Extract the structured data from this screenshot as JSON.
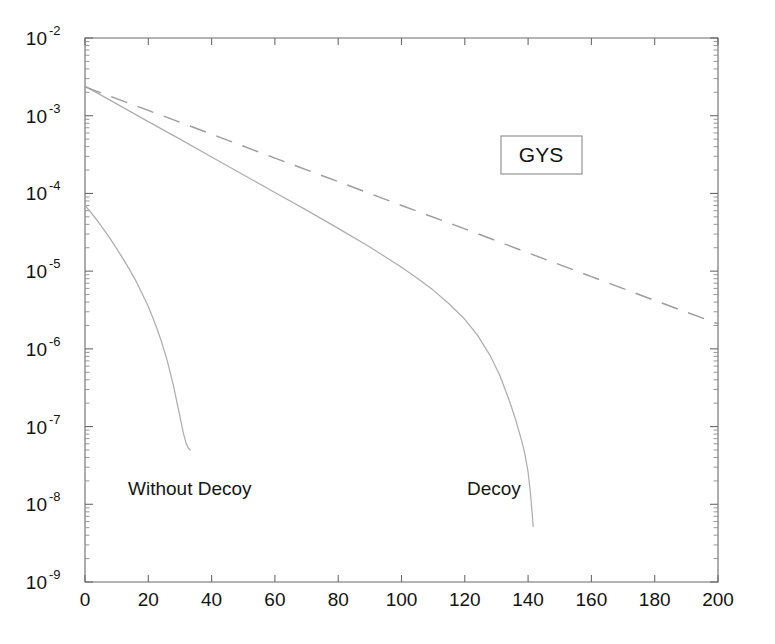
{
  "chart_data": {
    "type": "line",
    "title": "",
    "xlabel": "",
    "ylabel": "",
    "xlim": [
      0,
      200
    ],
    "ylim": [
      1e-09,
      0.01
    ],
    "yscale": "log",
    "xscale": "linear",
    "grid": false,
    "legend_position": "inside-upper-right",
    "legend_entries": [
      "GYS"
    ],
    "xticks": [
      0,
      20,
      40,
      60,
      80,
      100,
      120,
      140,
      160,
      180,
      200
    ],
    "xtick_labels": [
      "0",
      "20",
      "40",
      "60",
      "80",
      "100",
      "120",
      "140",
      "160",
      "180",
      "200"
    ],
    "yticks": [
      1e-09,
      1e-08,
      1e-07,
      1e-06,
      1e-05,
      0.0001,
      0.001,
      0.01
    ],
    "ytick_labels": [
      "10-9",
      "10-8",
      "10-7",
      "10-6",
      "10-5",
      "10-4",
      "10-3",
      "10-2"
    ],
    "ytick_base": "10",
    "ytick_exponents": [
      "-9",
      "-8",
      "-7",
      "-6",
      "-5",
      "-4",
      "-3",
      "-2"
    ],
    "annotations": [
      {
        "text": "Without Decoy",
        "x": 14,
        "y": 1.7e-08
      },
      {
        "text": "Decoy",
        "x": 117,
        "y": 1.7e-08
      },
      {
        "text": "GYS",
        "x": 156,
        "y": 0.00032,
        "boxed": true
      }
    ],
    "series": [
      {
        "name": "Without Decoy",
        "style": "solid",
        "color": "#aeaeae",
        "x": [
          0,
          2,
          4,
          6,
          8,
          10,
          12,
          14,
          16,
          18,
          20,
          22,
          24,
          26,
          28,
          29,
          30,
          31,
          32,
          32.5,
          33,
          33.2
        ],
        "y": [
          7e-05,
          5.6e-05,
          4.4e-05,
          3.4e-05,
          2.6e-05,
          1.95e-05,
          1.45e-05,
          1.06e-05,
          7.6e-06,
          5.2e-06,
          3.5e-06,
          2.2e-06,
          1.3e-06,
          7e-07,
          3.3e-07,
          2.1e-07,
          1.35e-07,
          8.5e-08,
          6e-08,
          5.4e-08,
          5.1e-08,
          5e-08
        ]
      },
      {
        "name": "Decoy",
        "style": "solid",
        "color": "#aeaeae",
        "x": [
          0,
          10,
          20,
          30,
          40,
          50,
          60,
          70,
          80,
          90,
          100,
          105,
          110,
          115,
          120,
          124,
          128,
          131,
          134,
          136,
          138,
          139,
          140,
          140.8,
          141.3,
          141.6
        ],
        "y": [
          0.0024,
          0.00142,
          0.00084,
          0.0005,
          0.000295,
          0.000174,
          0.000103,
          6.1e-05,
          3.55e-05,
          2.05e-05,
          1.12e-05,
          8.1e-06,
          5.7e-06,
          3.8e-06,
          2.4e-06,
          1.5e-06,
          8.2e-07,
          4.6e-07,
          2.2e-07,
          1.25e-07,
          6.5e-08,
          4.4e-08,
          2.6e-08,
          1.3e-08,
          7.5e-09,
          5.2e-09
        ]
      },
      {
        "name": "GYS",
        "style": "dashed",
        "color": "#9d9d9d",
        "x": [
          0,
          20,
          40,
          60,
          80,
          100,
          120,
          140,
          160,
          180,
          200
        ],
        "y": [
          0.00235,
          0.00117,
          0.00058,
          0.000285,
          0.000142,
          7e-05,
          3.5e-05,
          1.72e-05,
          8.5e-06,
          4.2e-06,
          2.1e-06
        ]
      }
    ]
  },
  "legend": {
    "label": "GYS"
  },
  "labels": {
    "without_decoy": "Without Decoy",
    "decoy": "Decoy"
  }
}
